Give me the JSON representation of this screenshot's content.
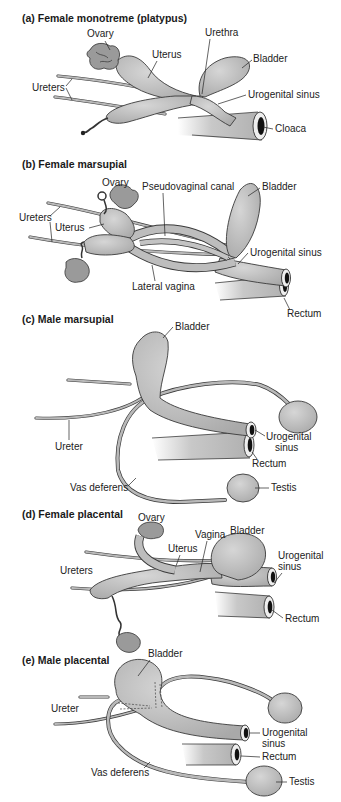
{
  "panels": [
    {
      "id": "a",
      "title": "(a) Female monotreme (platypus)",
      "labels": {
        "ovary": "Ovary",
        "uterus": "Uterus",
        "urethra": "Urethra",
        "bladder": "Bladder",
        "ureters": "Ureters",
        "urogenital_sinus": "Urogenital sinus",
        "cloaca": "Cloaca"
      }
    },
    {
      "id": "b",
      "title": "(b) Female marsupial",
      "labels": {
        "ovary": "Ovary",
        "pseudovaginal_canal": "Pseudovaginal canal",
        "bladder": "Bladder",
        "ureters": "Ureters",
        "uterus": "Uterus",
        "urogenital_sinus": "Urogenital sinus",
        "lateral_vagina": "Lateral vagina",
        "rectum": "Rectum"
      }
    },
    {
      "id": "c",
      "title": "(c) Male marsupial",
      "labels": {
        "bladder": "Bladder",
        "ureter": "Ureter",
        "urogenital_sinus_1": "Urogenital",
        "urogenital_sinus_2": "sinus",
        "rectum": "Rectum",
        "vas_deferens": "Vas deferens",
        "testis": "Testis"
      }
    },
    {
      "id": "d",
      "title": "(d) Female placental",
      "labels": {
        "ovary": "Ovary",
        "vagina": "Vagina",
        "bladder": "Bladder",
        "uterus": "Uterus",
        "urogenital_sinus_1": "Urogenital",
        "urogenital_sinus_2": "sinus",
        "ureters": "Ureters",
        "rectum": "Rectum"
      }
    },
    {
      "id": "e",
      "title": "(e) Male placental",
      "labels": {
        "bladder": "Bladder",
        "ureter": "Ureter",
        "urogenital_sinus_1": "Urogenital",
        "urogenital_sinus_2": "sinus",
        "rectum": "Rectum",
        "vas_deferens": "Vas deferens",
        "testis": "Testis"
      }
    }
  ],
  "colors": {
    "organ_light": "#d4d4d4",
    "organ_dark": "#a8a8a8",
    "outline": "#3a3a3a",
    "text": "#222222"
  }
}
